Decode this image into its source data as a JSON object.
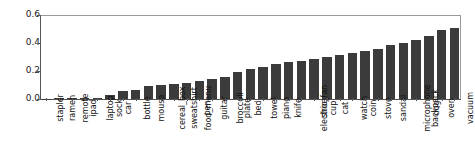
{
  "chart_data": {
    "type": "bar",
    "title": "",
    "xlabel": "",
    "ylabel": "",
    "ylim": [
      0.0,
      0.6
    ],
    "yticks": [
      0.0,
      0.2,
      0.4,
      0.6
    ],
    "ytick_labels": [
      "0.0",
      "0.2",
      "0.4",
      "0.6"
    ],
    "grid": false,
    "legend": null,
    "bar_color": "#3b3b3b",
    "categories": [
      "stapler",
      "ramen",
      "remote",
      "ipad",
      "laptop",
      "sock",
      "car",
      "bottle",
      "mouse",
      "cereal_box",
      "sweatshirt",
      "food_menu",
      "pen",
      "guitar",
      "broccoli",
      "plate",
      "bed",
      "towel",
      "piano",
      "knife",
      "electric_fan",
      "shoe",
      "cup",
      "cat",
      "watch",
      "coin",
      "stove",
      "sandal",
      "microphone",
      "backpack",
      "dog",
      "oven",
      "vacuum"
    ],
    "values": [
      0.003,
      0.004,
      0.006,
      0.008,
      0.01,
      0.03,
      0.06,
      0.065,
      0.09,
      0.1,
      0.11,
      0.115,
      0.13,
      0.145,
      0.16,
      0.195,
      0.215,
      0.23,
      0.25,
      0.265,
      0.275,
      0.285,
      0.3,
      0.315,
      0.33,
      0.345,
      0.36,
      0.385,
      0.4,
      0.425,
      0.45,
      0.49,
      0.505
    ]
  }
}
